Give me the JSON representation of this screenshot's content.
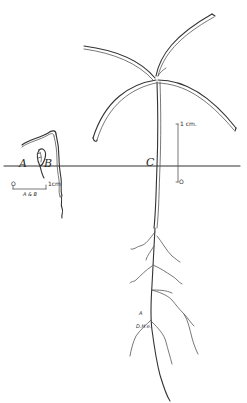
{
  "figure": {
    "type": "botanical line drawing",
    "colors": {
      "ink": "#333333",
      "background": "#ffffff"
    }
  },
  "labels": {
    "a": "A",
    "b": "B",
    "c": "C",
    "root_a": "A",
    "signature": "D.H.e."
  },
  "scale_bars": {
    "ab": {
      "zero": "O",
      "unit": "1cm",
      "caption": "A & B"
    },
    "c": {
      "zero": "O",
      "unit": "1 cm."
    }
  }
}
